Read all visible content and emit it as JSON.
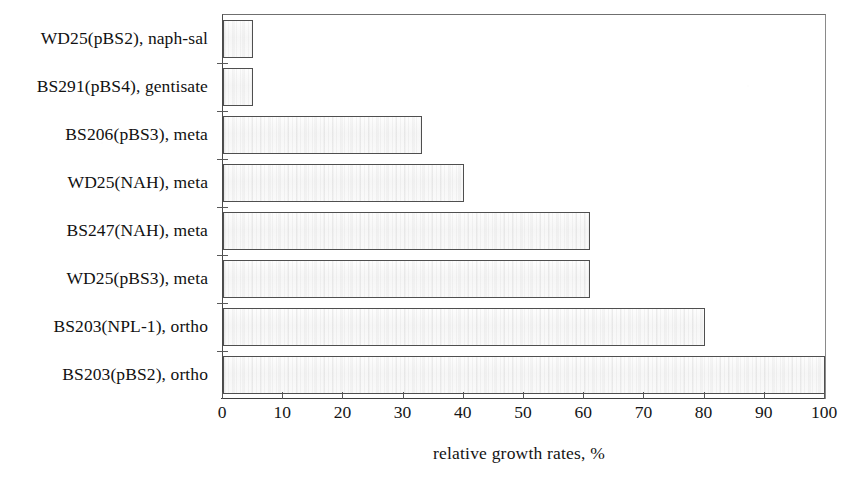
{
  "chart_data": {
    "type": "bar",
    "orientation": "horizontal",
    "title": "",
    "xlabel": "relative growth rates, %",
    "ylabel": "",
    "xlim": [
      0,
      100
    ],
    "xticks": [
      0,
      10,
      20,
      30,
      40,
      50,
      60,
      70,
      80,
      90,
      100
    ],
    "xticklabels": [
      "0",
      "10",
      "20",
      "30",
      "40",
      "50",
      "60",
      "70",
      "80",
      "90",
      "100"
    ],
    "grid": false,
    "legend": null,
    "categories": [
      "WD25(pBS2), naph-sal",
      "BS291(pBS4), gentisate",
      "BS206(pBS3), meta",
      "WD25(NAH), meta",
      "BS247(NAH), meta",
      "WD25(pBS3), meta",
      "BS203(NPL-1), ortho",
      "BS203(pBS2), ortho"
    ],
    "values": [
      5,
      5,
      33,
      40,
      61,
      61,
      80,
      100
    ],
    "bars": [
      {
        "label": "WD25(pBS2), naph-sal",
        "value": 5
      },
      {
        "label": "BS291(pBS4), gentisate",
        "value": 5
      },
      {
        "label": "BS206(pBS3), meta",
        "value": 33
      },
      {
        "label": "WD25(NAH), meta",
        "value": 40
      },
      {
        "label": "BS247(NAH), meta",
        "value": 61
      },
      {
        "label": "WD25(pBS3), meta",
        "value": 61
      },
      {
        "label": "BS203(NPL-1), ortho",
        "value": 80
      },
      {
        "label": "BS203(pBS2), ortho",
        "value": 100
      }
    ],
    "colors": {
      "bar_fill": "#fafafa",
      "bar_border": "#4f4f4f",
      "axis": "#3f3f3f",
      "text": "#111111",
      "background": "#ffffff"
    }
  }
}
